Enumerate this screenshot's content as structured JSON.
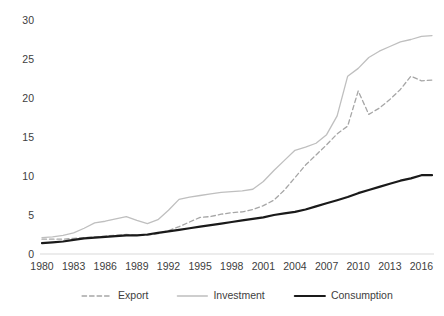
{
  "chart_data": {
    "type": "line",
    "title": "",
    "subtitle": "",
    "xlabel": "",
    "ylabel": "",
    "xlim": [
      1980,
      2017
    ],
    "ylim": [
      0,
      30
    ],
    "grid": false,
    "legend_position": "bottom",
    "x_tick_labels": [
      "1980",
      "1983",
      "1986",
      "1989",
      "1992",
      "1995",
      "1998",
      "2001",
      "2004",
      "2007",
      "2010",
      "2013",
      "2016"
    ],
    "x_tick_values": [
      1980,
      1983,
      1986,
      1989,
      1992,
      1995,
      1998,
      2001,
      2004,
      2007,
      2010,
      2013,
      2016
    ],
    "y_tick_labels": [
      "0",
      "5",
      "10",
      "15",
      "20",
      "25",
      "30"
    ],
    "y_tick_values": [
      0,
      5,
      10,
      15,
      20,
      25,
      30
    ],
    "x": [
      1980,
      1981,
      1982,
      1983,
      1984,
      1985,
      1986,
      1987,
      1988,
      1989,
      1990,
      1991,
      1992,
      1993,
      1994,
      1995,
      1996,
      1997,
      1998,
      1999,
      2000,
      2001,
      2002,
      2003,
      2004,
      2005,
      2006,
      2007,
      2008,
      2009,
      2010,
      2011,
      2012,
      2013,
      2014,
      2015,
      2016,
      2017
    ],
    "series": [
      {
        "name": "Export",
        "color": "#a6a6a6",
        "style": "dashed",
        "width": 1.3,
        "values": [
          1.9,
          1.9,
          1.9,
          2.0,
          2.1,
          2.2,
          2.3,
          2.4,
          2.5,
          2.4,
          2.4,
          2.6,
          3.0,
          3.5,
          4.1,
          4.7,
          4.8,
          5.1,
          5.3,
          5.4,
          5.7,
          6.2,
          6.9,
          8.2,
          9.8,
          11.4,
          12.7,
          14.0,
          15.4,
          16.4,
          20.9,
          17.9,
          18.7,
          19.8,
          21.1,
          22.8,
          22.2,
          22.3
        ]
      },
      {
        "name": "Investment",
        "color": "#bfbfbf",
        "style": "solid",
        "width": 1.3,
        "values": [
          2.1,
          2.2,
          2.4,
          2.7,
          3.3,
          4.0,
          4.2,
          4.5,
          4.8,
          4.3,
          3.9,
          4.4,
          5.6,
          7.0,
          7.3,
          7.5,
          7.7,
          7.9,
          8.0,
          8.1,
          8.3,
          9.3,
          10.7,
          12.0,
          13.3,
          13.7,
          14.2,
          15.3,
          17.7,
          22.8,
          23.8,
          25.2,
          26.0,
          26.6,
          27.2,
          27.5,
          27.9,
          28.0
        ]
      },
      {
        "name": "Consumption",
        "color": "#1a1a1a",
        "style": "solid",
        "width": 2.2,
        "values": [
          1.4,
          1.5,
          1.6,
          1.8,
          2.0,
          2.1,
          2.2,
          2.3,
          2.4,
          2.4,
          2.5,
          2.7,
          2.9,
          3.1,
          3.3,
          3.5,
          3.7,
          3.9,
          4.1,
          4.3,
          4.5,
          4.7,
          5.0,
          5.2,
          5.4,
          5.7,
          6.1,
          6.5,
          6.9,
          7.3,
          7.8,
          8.2,
          8.6,
          9.0,
          9.4,
          9.7,
          10.1,
          10.1
        ]
      }
    ],
    "legend": [
      {
        "label": "Export",
        "color": "#a6a6a6",
        "style": "dashed",
        "width": 1.3
      },
      {
        "label": "Investment",
        "color": "#bfbfbf",
        "style": "solid",
        "width": 1.3
      },
      {
        "label": "Consumption",
        "color": "#1a1a1a",
        "style": "solid",
        "width": 2.2
      }
    ]
  }
}
